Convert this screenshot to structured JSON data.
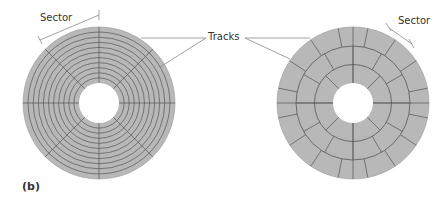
{
  "figure": {
    "panel_label": "(b)",
    "left_disk": {
      "label_sector": "Sector",
      "description": "Constant sectors per track: concentric tracks divided by radial lines",
      "tracks": 10,
      "sectors_per_track": 8
    },
    "right_disk": {
      "label_sector": "Sector",
      "description": "Zoned recording: more sectors on outer tracks",
      "zones": [
        {
          "name": "inner",
          "sectors": 8
        },
        {
          "name": "middle",
          "sectors": 12
        },
        {
          "name": "outer",
          "sectors": 16
        }
      ]
    },
    "shared_label_tracks": "Tracks",
    "colors": {
      "disk_fill": "#b8b8b8",
      "line": "#555555",
      "leader": "#8a8a8a",
      "text": "#333333"
    }
  }
}
